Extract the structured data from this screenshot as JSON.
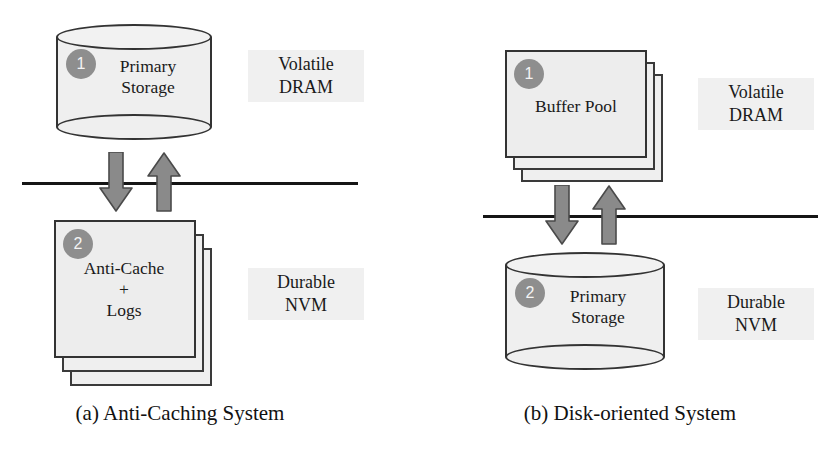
{
  "figure": {
    "colors": {
      "shape_fill": "#efefef",
      "shape_stroke": "#333333",
      "badge_fill": "#8e8e8e",
      "badge_text": "#f4f4f4",
      "arrow_fill": "#8a8a8a",
      "arrow_stroke": "#4a4a4a",
      "divider": "#151515",
      "text": "#1a1a1a",
      "background": "#ffffff"
    }
  },
  "panels": [
    {
      "id": "a",
      "caption": "(a) Anti-Caching System",
      "upper": {
        "shape": "cylinder",
        "badge": "1",
        "label": "Primary\nStorage",
        "side_label": "Volatile\nDRAM",
        "tier": "volatile"
      },
      "lower": {
        "shape": "stack",
        "badge": "2",
        "label": "Anti-Cache\n+\nLogs",
        "side_label": "Durable\nNVM",
        "tier": "durable"
      },
      "arrows": [
        {
          "direction": "down",
          "name": "evict-arrow"
        },
        {
          "direction": "up",
          "name": "fetch-arrow"
        }
      ],
      "divider": "memory-storage-boundary"
    },
    {
      "id": "b",
      "caption": "(b) Disk-oriented System",
      "upper": {
        "shape": "stack",
        "badge": "1",
        "label": "Buffer Pool",
        "side_label": "Volatile\nDRAM",
        "tier": "volatile"
      },
      "lower": {
        "shape": "cylinder",
        "badge": "2",
        "label": "Primary\nStorage",
        "side_label": "Durable\nNVM",
        "tier": "durable"
      },
      "arrows": [
        {
          "direction": "down",
          "name": "write-arrow"
        },
        {
          "direction": "up",
          "name": "read-arrow"
        }
      ],
      "divider": "memory-storage-boundary"
    }
  ]
}
